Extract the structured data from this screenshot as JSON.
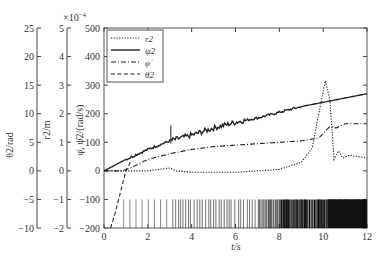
{
  "chart_data": {
    "type": "line",
    "xlabel": "t/s",
    "x_ticks": [
      0,
      2,
      4,
      6,
      8,
      10,
      12
    ],
    "xlim": [
      0,
      12
    ],
    "axes": [
      {
        "label": "θ2/rad",
        "ticks": [
          25,
          20,
          15,
          10,
          5,
          0,
          -5,
          -10
        ],
        "ylim": [
          -10,
          25
        ]
      },
      {
        "label": "r2/m",
        "ticks": [
          5,
          4,
          3,
          2,
          1,
          0,
          -1,
          -2
        ],
        "ylim": [
          -2,
          5
        ],
        "multiplier": "×10^-4"
      },
      {
        "label": "φ̇, ψ̇2/(rad/s)",
        "ticks": [
          500,
          400,
          300,
          200,
          100,
          0,
          -100,
          -200
        ],
        "ylim": [
          -200,
          500
        ]
      }
    ],
    "legend": [
      "r2",
      "ψ̇2",
      "φ̇",
      "θ2"
    ],
    "legend_position": "upper left",
    "series": [
      {
        "name": "r2",
        "style": "dotted",
        "x": [
          0,
          1,
          2,
          3,
          3.3,
          4,
          6,
          8,
          9,
          9.5,
          9.8,
          10.1,
          10.3,
          10.5,
          10.7,
          10.9,
          11.2,
          12
        ],
        "y": [
          0,
          0,
          0,
          10,
          0,
          -5,
          -5,
          5,
          30,
          80,
          200,
          315,
          250,
          40,
          70,
          45,
          55,
          45
        ]
      },
      {
        "name": "ψ̇2",
        "style": "solid",
        "x": [
          0,
          1,
          2,
          3,
          4,
          5,
          6,
          7,
          8,
          9,
          10,
          11,
          12
        ],
        "y": [
          0,
          40,
          75,
          105,
          125,
          150,
          170,
          185,
          205,
          225,
          240,
          255,
          270
        ]
      },
      {
        "name": "φ̇",
        "style": "dashdot",
        "x": [
          0,
          0.8,
          1.2,
          2,
          3,
          4,
          5,
          6,
          7,
          8,
          9,
          9.8,
          10.3,
          10.6,
          11,
          12
        ],
        "y": [
          0,
          0,
          10,
          40,
          60,
          75,
          85,
          90,
          95,
          100,
          105,
          115,
          155,
          150,
          165,
          165
        ]
      },
      {
        "name": "θ2",
        "style": "dashed",
        "x": [
          0.3,
          0.5,
          0.7,
          0.9,
          1.0,
          1.2
        ],
        "y": [
          -200,
          -150,
          -90,
          -30,
          0,
          30
        ]
      }
    ],
    "event_bars": {
      "y_range": [
        -200,
        -100
      ],
      "note": "dense vertical marks, sparse at t<3, dense t 3-12"
    }
  }
}
